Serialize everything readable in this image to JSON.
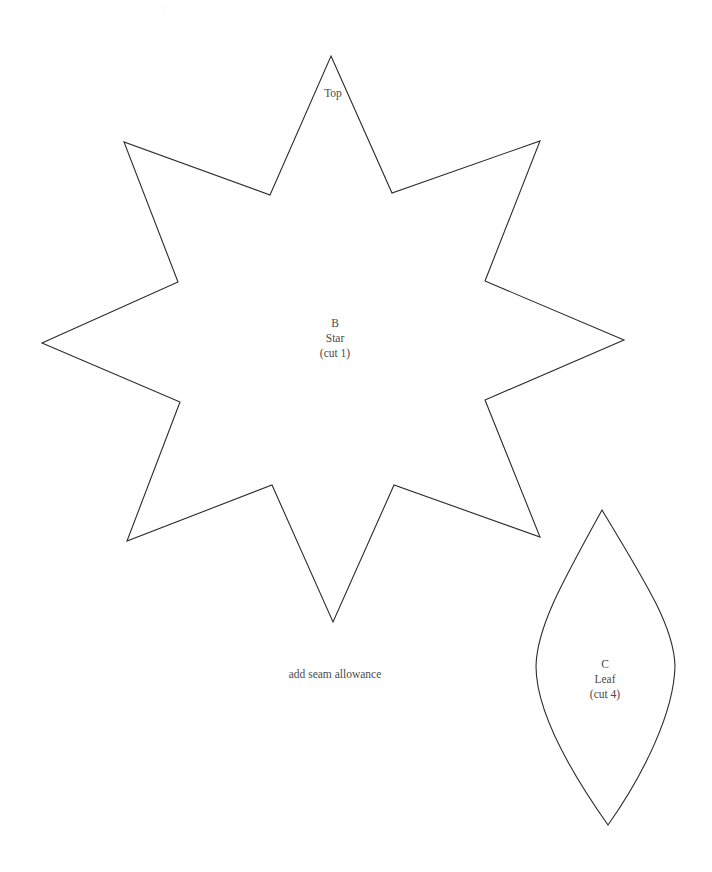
{
  "sheet": {
    "kind": "sewing-pattern-template",
    "background_color": "#ffffff",
    "ink_color": "#2b2b2b",
    "text_color": "#4a4a4a",
    "width": 712,
    "height": 872
  },
  "pieces": {
    "star": {
      "orientation_label": "Top",
      "letter": "B",
      "name": "Star",
      "cut_instruction": "(cut 1)",
      "points": 8,
      "outline_path": "M 331 56 L 392 193 L 540 141 L 485 281 L 624 340 L 485 400 L 540 537 L 394 485 L 333 622 L 272 485 L 127 541 L 180 402 L 42 343 L 178 282 L 124 142 L 270 195 Z"
    },
    "leaf": {
      "letter": "C",
      "name": "Leaf",
      "cut_instruction": "(cut 4)",
      "outline_path": "M 602 510 C 648 586 674 628 675 666 C 674 712 644 774 608 825 C 572 774 536 712 536 666 C 537 628 560 586 602 510 Z"
    }
  },
  "notes": {
    "seam_allowance": "add seam allowance"
  }
}
